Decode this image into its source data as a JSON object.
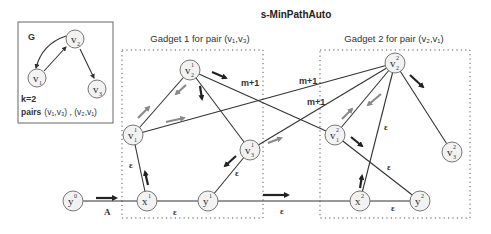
{
  "title": "s-MinPathAuto",
  "graph_g": {
    "label": "G",
    "k_label": "k=2",
    "pairs_prefix": "pairs",
    "pairs_value": "(v₁,v₃) , (v₂,v₁)",
    "nodes": {
      "v1": {
        "base": "v",
        "sub": "1"
      },
      "v2": {
        "base": "v",
        "sub": "2"
      },
      "v3": {
        "base": "v",
        "sub": "3"
      }
    }
  },
  "gadget1": {
    "title": "Gadget 1 for pair (v₁,v₃)"
  },
  "gadget2": {
    "title": "Gadget 2 for pair (v₂,v₁)"
  },
  "nodes": {
    "y0": {
      "base": "y",
      "sup": "0",
      "sub": ""
    },
    "x1": {
      "base": "x",
      "sup": "1",
      "sub": ""
    },
    "y1": {
      "base": "y",
      "sup": "1",
      "sub": ""
    },
    "v1_1": {
      "base": "v",
      "sup": "1",
      "sub": "1"
    },
    "v2_1": {
      "base": "v",
      "sup": "1",
      "sub": "2"
    },
    "v3_1": {
      "base": "v",
      "sup": "1",
      "sub": "3"
    },
    "x2": {
      "base": "x",
      "sup": "2",
      "sub": ""
    },
    "y2": {
      "base": "y",
      "sup": "2",
      "sub": ""
    },
    "v1_2": {
      "base": "v",
      "sup": "2",
      "sub": "1"
    },
    "v2_2": {
      "base": "v",
      "sup": "2",
      "sub": "2"
    },
    "v3_2": {
      "base": "v",
      "sup": "2",
      "sub": "3"
    }
  },
  "edge_labels": {
    "a": "A",
    "eps": "ε",
    "m_plus_1": "m+1"
  },
  "colors": {
    "line": "#333333",
    "arrow_dark": "#222222",
    "arrow_gray": "#8a8a8a",
    "node_fill": "#f2f2f2"
  }
}
